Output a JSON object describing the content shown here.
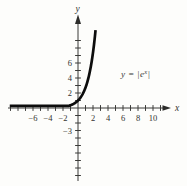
{
  "figure": {
    "background": "#fdfdfb",
    "ink_color": "#3a3a38",
    "curve_color": "#0d0d0d",
    "eq_prefix": "y = |e",
    "eq_sup": "x",
    "eq_suffix": "|"
  },
  "chart_data": {
    "type": "line",
    "title": "",
    "equation_label": "y = |e^x|",
    "xlabel": "x",
    "ylabel": "y",
    "grid": false,
    "legend": false,
    "x_axis": {
      "min_shown": -9,
      "max_shown": 11,
      "tick_step": 1,
      "tick_labels": [
        {
          "value": -6,
          "text": "−6"
        },
        {
          "value": -4,
          "text": "−4"
        },
        {
          "value": -2,
          "text": "−2"
        },
        {
          "value": 2,
          "text": "2"
        },
        {
          "value": 4,
          "text": "4"
        },
        {
          "value": 6,
          "text": "6"
        },
        {
          "value": 8,
          "text": "8"
        },
        {
          "value": 10,
          "text": "10"
        }
      ]
    },
    "y_axis": {
      "min_shown": -9,
      "max_shown": 9,
      "tick_step": 1,
      "tick_labels": [
        {
          "value": 6,
          "text": "6"
        },
        {
          "value": 4,
          "text": "4"
        },
        {
          "value": 2,
          "text": "2"
        },
        {
          "value": -3,
          "text": "−3"
        }
      ]
    },
    "series": [
      {
        "name": "y = |e^x|",
        "function": "abs(exp(x))",
        "x_plot_range": [
          -9.1,
          2.34
        ],
        "points": [
          {
            "x": -8,
            "y": 0.0003
          },
          {
            "x": -6,
            "y": 0.0025
          },
          {
            "x": -4,
            "y": 0.0183
          },
          {
            "x": -2,
            "y": 0.1353
          },
          {
            "x": -1,
            "y": 0.3679
          },
          {
            "x": 0,
            "y": 1
          },
          {
            "x": 1,
            "y": 2.7183
          },
          {
            "x": 2,
            "y": 7.3891
          },
          {
            "x": 2.3,
            "y": 9.9742
          }
        ]
      }
    ]
  }
}
